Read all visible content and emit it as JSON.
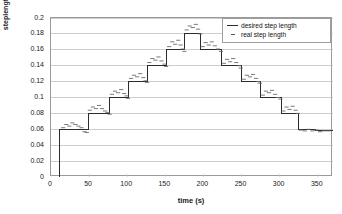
{
  "chart_data": {
    "type": "line",
    "title": "",
    "xlabel": "time (s)",
    "ylabel": "steplength (m)",
    "xlim": [
      0,
      370
    ],
    "ylim": [
      0,
      0.2
    ],
    "grid": "horizontal",
    "legend_position": "top-right",
    "xticks": [
      0,
      50,
      100,
      150,
      200,
      250,
      300,
      350
    ],
    "xticklabels": [
      "0",
      "50",
      "100",
      "150",
      "200",
      "250",
      "300",
      "350"
    ],
    "yticks": [
      0,
      0.02,
      0.04,
      0.06,
      0.08,
      0.1,
      0.12,
      0.14,
      0.16,
      0.18,
      0.2
    ],
    "yticklabels": [
      "0",
      "0.02",
      "0.04",
      "0.06",
      "0.08",
      "0.1",
      "0.12",
      "0.14",
      "0.16",
      "0.18",
      "0.2"
    ],
    "series": [
      {
        "name": "desired step length",
        "style": "step",
        "color": "#2b2b2b",
        "x": [
          11,
          11,
          49,
          49,
          77,
          77,
          102,
          102,
          126,
          126,
          152,
          152,
          175,
          175,
          196,
          196,
          224,
          224,
          250,
          250,
          275,
          275,
          302,
          302,
          325,
          325,
          347,
          347,
          370
        ],
        "y": [
          0,
          0.06,
          0.06,
          0.08,
          0.08,
          0.1,
          0.1,
          0.12,
          0.12,
          0.14,
          0.14,
          0.16,
          0.16,
          0.18,
          0.18,
          0.16,
          0.16,
          0.14,
          0.14,
          0.12,
          0.12,
          0.1,
          0.1,
          0.08,
          0.08,
          0.06,
          0.06,
          0.058,
          0.058
        ],
        "plateaus": [
          {
            "t_start": 11,
            "t_end": 49,
            "value": 0.06
          },
          {
            "t_start": 49,
            "t_end": 77,
            "value": 0.08
          },
          {
            "t_start": 77,
            "t_end": 102,
            "value": 0.1
          },
          {
            "t_start": 102,
            "t_end": 126,
            "value": 0.12
          },
          {
            "t_start": 126,
            "t_end": 152,
            "value": 0.14
          },
          {
            "t_start": 152,
            "t_end": 175,
            "value": 0.16
          },
          {
            "t_start": 175,
            "t_end": 196,
            "value": 0.18
          },
          {
            "t_start": 196,
            "t_end": 224,
            "value": 0.16
          },
          {
            "t_start": 224,
            "t_end": 250,
            "value": 0.14
          },
          {
            "t_start": 250,
            "t_end": 275,
            "value": 0.12
          },
          {
            "t_start": 275,
            "t_end": 302,
            "value": 0.1
          },
          {
            "t_start": 302,
            "t_end": 325,
            "value": 0.08
          },
          {
            "t_start": 325,
            "t_end": 370,
            "value": 0.06
          }
        ]
      },
      {
        "name": "real step length",
        "style": "dashes",
        "color": "#6b6b6b",
        "points": [
          [
            16,
            0.062
          ],
          [
            20,
            0.066
          ],
          [
            24,
            0.064
          ],
          [
            28,
            0.068
          ],
          [
            32,
            0.066
          ],
          [
            36,
            0.064
          ],
          [
            40,
            0.062
          ],
          [
            44,
            0.057
          ],
          [
            47,
            0.056
          ],
          [
            51,
            0.084
          ],
          [
            55,
            0.088
          ],
          [
            59,
            0.086
          ],
          [
            63,
            0.09
          ],
          [
            67,
            0.086
          ],
          [
            71,
            0.083
          ],
          [
            74,
            0.081
          ],
          [
            77,
            0.079
          ],
          [
            80,
            0.104
          ],
          [
            84,
            0.108
          ],
          [
            88,
            0.106
          ],
          [
            92,
            0.11
          ],
          [
            96,
            0.105
          ],
          [
            99,
            0.102
          ],
          [
            101,
            0.099
          ],
          [
            105,
            0.124
          ],
          [
            109,
            0.128
          ],
          [
            113,
            0.126
          ],
          [
            117,
            0.13
          ],
          [
            121,
            0.125
          ],
          [
            124,
            0.121
          ],
          [
            126,
            0.119
          ],
          [
            129,
            0.144
          ],
          [
            133,
            0.149
          ],
          [
            137,
            0.147
          ],
          [
            141,
            0.151
          ],
          [
            145,
            0.146
          ],
          [
            149,
            0.142
          ],
          [
            151,
            0.139
          ],
          [
            155,
            0.164
          ],
          [
            159,
            0.17
          ],
          [
            163,
            0.167
          ],
          [
            167,
            0.172
          ],
          [
            170,
            0.166
          ],
          [
            173,
            0.161
          ],
          [
            175,
            0.158
          ],
          [
            178,
            0.185
          ],
          [
            182,
            0.19
          ],
          [
            186,
            0.188
          ],
          [
            190,
            0.192
          ],
          [
            193,
            0.186
          ],
          [
            196,
            0.18
          ],
          [
            199,
            0.164
          ],
          [
            203,
            0.169
          ],
          [
            207,
            0.166
          ],
          [
            211,
            0.17
          ],
          [
            215,
            0.165
          ],
          [
            219,
            0.161
          ],
          [
            223,
            0.158
          ],
          [
            227,
            0.143
          ],
          [
            231,
            0.148
          ],
          [
            235,
            0.145
          ],
          [
            239,
            0.149
          ],
          [
            243,
            0.144
          ],
          [
            247,
            0.14
          ],
          [
            249,
            0.137
          ],
          [
            253,
            0.123
          ],
          [
            257,
            0.128
          ],
          [
            261,
            0.126
          ],
          [
            265,
            0.129
          ],
          [
            269,
            0.124
          ],
          [
            272,
            0.12
          ],
          [
            274,
            0.118
          ],
          [
            278,
            0.103
          ],
          [
            282,
            0.108
          ],
          [
            286,
            0.106
          ],
          [
            290,
            0.109
          ],
          [
            294,
            0.104
          ],
          [
            298,
            0.1
          ],
          [
            301,
            0.098
          ],
          [
            305,
            0.083
          ],
          [
            309,
            0.088
          ],
          [
            313,
            0.085
          ],
          [
            317,
            0.089
          ],
          [
            321,
            0.084
          ],
          [
            324,
            0.08
          ],
          [
            328,
            0.059
          ],
          [
            333,
            0.058
          ],
          [
            338,
            0.06
          ],
          [
            343,
            0.058
          ],
          [
            348,
            0.059
          ],
          [
            353,
            0.057
          ],
          [
            358,
            0.058
          ],
          [
            364,
            0.058
          ]
        ]
      }
    ]
  },
  "legend": {
    "items": [
      {
        "label": "desired step length"
      },
      {
        "label": "real step length"
      }
    ]
  }
}
